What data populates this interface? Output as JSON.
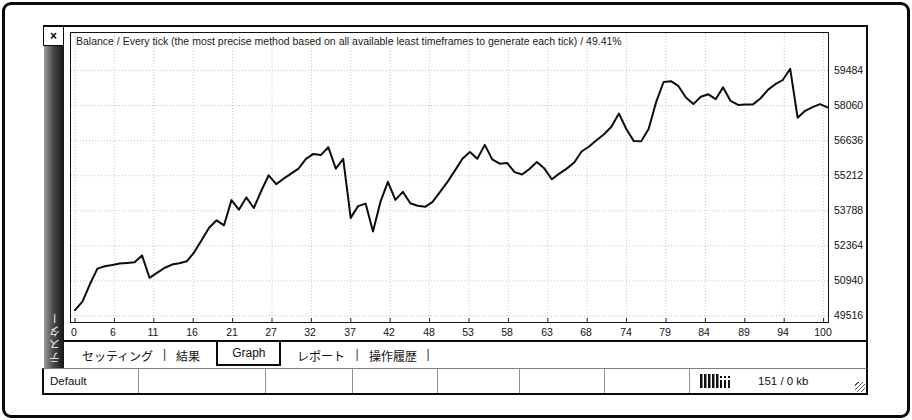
{
  "window": {
    "close_label": "×",
    "sidebar_label": "テスター"
  },
  "chart_data": {
    "type": "line",
    "title": "Balance / Every tick (the most precise method based on all available least timeframes to generate each tick) / 49.41%",
    "xlabel": "",
    "ylabel": "",
    "x_tick_labels": [
      "0",
      "6",
      "11",
      "16",
      "21",
      "27",
      "32",
      "37",
      "42",
      "48",
      "53",
      "58",
      "63",
      "68",
      "74",
      "79",
      "84",
      "89",
      "94",
      "100"
    ],
    "y_tick_labels": [
      "59484",
      "58060",
      "56636",
      "55212",
      "53788",
      "52364",
      "50940",
      "49516"
    ],
    "ylim": [
      49270,
      61010
    ],
    "xlim": [
      0,
      101
    ],
    "grid": "dotted",
    "line_color": "#0d0d0d",
    "series": [
      {
        "name": "Balance",
        "values": [
          49750,
          50100,
          50800,
          51440,
          51535,
          51590,
          51650,
          51670,
          51695,
          51975,
          51065,
          51270,
          51465,
          51600,
          51660,
          51735,
          52100,
          52600,
          53100,
          53400,
          53200,
          54220,
          53830,
          54330,
          53900,
          54600,
          55230,
          54870,
          55090,
          55300,
          55500,
          55900,
          56100,
          56050,
          56370,
          55500,
          55900,
          53500,
          53980,
          54080,
          52950,
          54150,
          54960,
          54230,
          54560,
          54090,
          53990,
          53950,
          54150,
          54560,
          54960,
          55420,
          55900,
          56170,
          55900,
          56465,
          55875,
          55700,
          55730,
          55360,
          55260,
          55480,
          55765,
          55500,
          55065,
          55300,
          55500,
          55750,
          56195,
          56400,
          56650,
          56900,
          57200,
          57740,
          57110,
          56620,
          56610,
          57110,
          58200,
          59020,
          59050,
          58850,
          58390,
          58120,
          58420,
          58520,
          58320,
          58800,
          58250,
          58090,
          58100,
          58110,
          58350,
          58700,
          58930,
          59100,
          59555,
          57570,
          57850,
          58000,
          58120,
          57990
        ]
      }
    ]
  },
  "tabs": {
    "separator": "|",
    "items": [
      {
        "label": "セッティング",
        "name": "tab-settings",
        "active": false
      },
      {
        "label": "結果",
        "name": "tab-results",
        "active": false
      },
      {
        "label": "Graph",
        "name": "tab-graph",
        "active": true
      },
      {
        "label": "レポート",
        "name": "tab-report",
        "active": false
      },
      {
        "label": "操作履歴",
        "name": "tab-journal",
        "active": false
      }
    ]
  },
  "status_bar": {
    "preset": "Default",
    "traffic": "151 / 0 kb",
    "icon": "traffic-bars-icon"
  }
}
